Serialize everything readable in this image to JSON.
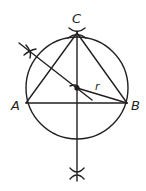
{
  "diagram": {
    "colors": {
      "ink": "#231f20",
      "background": "#ffffff"
    },
    "points": {
      "A": {
        "label": "A",
        "x": 26,
        "y": 103
      },
      "B": {
        "label": "B",
        "x": 127,
        "y": 103
      },
      "C": {
        "label": "C",
        "x": 77,
        "y": 33
      },
      "O": {
        "label": "",
        "x": 77,
        "y": 88
      }
    },
    "circle": {
      "cx": 77,
      "cy": 88,
      "r": 51
    },
    "radius_label": "r",
    "labels": {
      "A": "A",
      "B": "B",
      "C": "C",
      "r": "r"
    },
    "construction": {
      "perpendicular_bisector_AB": "vertical line through center with arc marks",
      "perpendicular_bisector_AC": "diagonal line through center with arc marks"
    }
  }
}
